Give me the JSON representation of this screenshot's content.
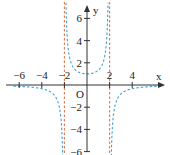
{
  "chart_data": {
    "type": "line",
    "title": "",
    "xlabel": "x",
    "ylabel": "y",
    "origin_label": "O",
    "xlim": [
      -6.5,
      6.8
    ],
    "ylim": [
      -6.5,
      7
    ],
    "grid": false,
    "x_ticks": [
      -6,
      -4,
      -2,
      2,
      4
    ],
    "y_ticks": [
      6,
      4,
      2,
      -2,
      -4,
      -6
    ],
    "x_tick_labels": [
      "−6",
      "−4",
      "−2",
      "2",
      "4"
    ],
    "y_tick_labels": [
      "6",
      "4",
      "2",
      "−2",
      "−4",
      "−6"
    ],
    "series": [
      {
        "name": "f(x) = 4/(4 - x^2)",
        "style": "dashed",
        "color": "#4a9fd4",
        "points_note": "y(0)=1; vertical asymptotes x=-2, x=2; horizontal asymptote y=0",
        "sample_points": [
          [
            -6,
            -0.125
          ],
          [
            -4,
            -0.333
          ],
          [
            -3,
            -0.8
          ],
          [
            -2.5,
            -1.78
          ],
          [
            -2.2,
            -4.76
          ],
          [
            -1.5,
            2.29
          ],
          [
            -1,
            1.33
          ],
          [
            0,
            1
          ],
          [
            1,
            1.33
          ],
          [
            1.5,
            2.29
          ],
          [
            2.2,
            -4.76
          ],
          [
            2.5,
            -1.78
          ],
          [
            3,
            -0.8
          ],
          [
            4,
            -0.333
          ],
          [
            6,
            -0.125
          ]
        ]
      }
    ],
    "asymptotes": [
      {
        "type": "vertical",
        "x": -2,
        "color": "#e0784a",
        "style": "dashed"
      },
      {
        "type": "vertical",
        "x": 2,
        "color": "#e0784a",
        "style": "dashed"
      }
    ]
  },
  "colors": {
    "axis": "#333333",
    "curve": "#4a9fd4",
    "asymptote": "#e0784a"
  }
}
